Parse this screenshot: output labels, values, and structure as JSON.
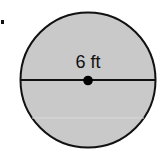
{
  "figure": {
    "problem_marker": ".",
    "shape": "circle",
    "measurement": {
      "label": "6 ft",
      "type": "diameter",
      "value": 6,
      "unit": "ft"
    },
    "colors": {
      "fill": "#c9c9c9",
      "stroke": "#111111",
      "center_point": "#000000",
      "background": "#ffffff"
    }
  }
}
